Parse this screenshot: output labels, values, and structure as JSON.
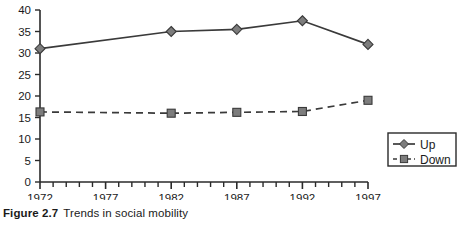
{
  "figure": {
    "caption_label": "Figure 2.7",
    "caption_text": "Trends in social mobility"
  },
  "legend": {
    "position": "bottom-right",
    "entries": [
      {
        "name": "Up",
        "marker": "diamond",
        "line": "solid",
        "color": "#3a3a3a"
      },
      {
        "name": "Down",
        "marker": "square",
        "line": "dashed",
        "color": "#3a3a3a"
      }
    ]
  },
  "axes": {
    "y_tick_labels": [
      "40",
      "35",
      "30",
      "25",
      "20",
      "15",
      "10",
      "5",
      "0"
    ],
    "x_tick_labels": [
      "1972",
      "1977",
      "1982",
      "1987",
      "1992",
      "1997"
    ]
  },
  "chart_data": {
    "type": "line",
    "title": "Trends in social mobility",
    "xlabel": "",
    "ylabel": "",
    "xlim": [
      1972,
      1997
    ],
    "ylim": [
      0,
      40
    ],
    "yticks": [
      0,
      5,
      10,
      15,
      20,
      25,
      30,
      35,
      40
    ],
    "xticks": [
      1972,
      1977,
      1982,
      1987,
      1992,
      1997
    ],
    "x_minor_tick_step": 1,
    "grid": false,
    "legend_position": "lower right",
    "x": [
      1972,
      1982,
      1987,
      1992,
      1997
    ],
    "series": [
      {
        "name": "Up",
        "marker": "diamond",
        "linestyle": "solid",
        "color": "#3a3a3a",
        "values": [
          31,
          35,
          35.5,
          37.5,
          32
        ]
      },
      {
        "name": "Down",
        "marker": "square",
        "linestyle": "dashed",
        "color": "#3a3a3a",
        "values": [
          16.3,
          16,
          16.2,
          16.4,
          19
        ]
      }
    ]
  }
}
